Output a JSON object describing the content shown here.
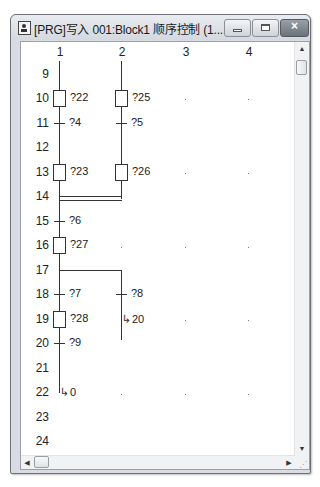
{
  "window": {
    "title": "[PRG]写入 001:Block1 顺序控制 (1...",
    "buttons": {
      "minimize": "minimize",
      "maximize": "maximize",
      "close": "×"
    }
  },
  "sfc": {
    "columns": [
      "1",
      "2",
      "3",
      "4"
    ],
    "rows": [
      "9",
      "10",
      "11",
      "12",
      "13",
      "14",
      "15",
      "16",
      "17",
      "18",
      "19",
      "20",
      "21",
      "22",
      "23",
      "24"
    ],
    "steps": [
      {
        "row": "10",
        "col": "1",
        "label": "?22"
      },
      {
        "row": "10",
        "col": "2",
        "label": "?25"
      },
      {
        "row": "13",
        "col": "1",
        "label": "?23"
      },
      {
        "row": "13",
        "col": "2",
        "label": "?26"
      },
      {
        "row": "16",
        "col": "1",
        "label": "?27"
      },
      {
        "row": "19",
        "col": "1",
        "label": "?28"
      }
    ],
    "transitions": [
      {
        "row": "11",
        "col": "1",
        "label": "?4"
      },
      {
        "row": "11",
        "col": "2",
        "label": "?5"
      },
      {
        "row": "15",
        "col": "1",
        "label": "?6"
      },
      {
        "row": "18",
        "col": "1",
        "label": "?7"
      },
      {
        "row": "18",
        "col": "2",
        "label": "?8"
      },
      {
        "row": "20",
        "col": "1",
        "label": "?9"
      }
    ],
    "jumps": [
      {
        "row": "19",
        "col": "2",
        "target": "20"
      },
      {
        "row": "22",
        "col": "1",
        "target": "0"
      }
    ],
    "parallel_merge_row": "14",
    "selection_branch_row": "17"
  },
  "scrollbars": {
    "up_arrow": "▲",
    "down_arrow": "▼",
    "left_arrow": "◀",
    "right_arrow": "▶"
  }
}
